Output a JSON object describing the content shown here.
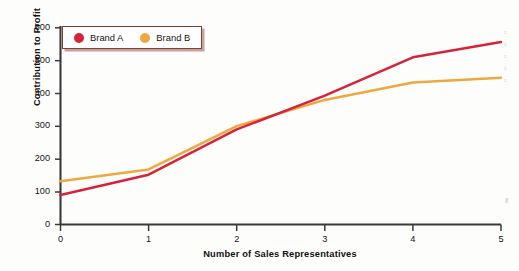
{
  "chart_data": {
    "type": "line",
    "title": "",
    "subtitle": "",
    "xlabel": "Number of Sales Representatives",
    "ylabel": "Contribution to Profit",
    "x": [
      0,
      1,
      2,
      3,
      4,
      5
    ],
    "xlim": [
      0,
      5
    ],
    "ylim": [
      0,
      600
    ],
    "x_ticks": [
      "0",
      "1",
      "2",
      "3",
      "4",
      "5"
    ],
    "y_ticks": [
      "0",
      "100",
      "200",
      "300",
      "400",
      "500",
      "600"
    ],
    "grid": false,
    "legend_position": "top-left",
    "series": [
      {
        "name": "Brand A",
        "color": "#D4233A",
        "values": [
          90,
          152,
          290,
          393,
          510,
          557
        ]
      },
      {
        "name": "Brand B",
        "color": "#EFA840",
        "values": [
          132,
          168,
          300,
          380,
          433,
          448
        ]
      }
    ],
    "annotations": []
  },
  "legend": {
    "entries": [
      {
        "label": "Brand A",
        "color": "#D4233A",
        "marker": "circle-marker"
      },
      {
        "label": "Brand B",
        "color": "#EFA840",
        "marker": "circle-marker"
      }
    ]
  },
  "axes": {
    "y_title": "Contribution to Profit",
    "x_title": "Number of Sales Representatives",
    "y_tick_labels": [
      "600",
      "500",
      "400",
      "300",
      "200",
      "100",
      "0"
    ],
    "x_tick_labels": [
      "0",
      "1",
      "2",
      "3",
      "4",
      "5"
    ],
    "axis_color": "#3a3a3a"
  },
  "edge_artifacts": {
    "fragments": [
      "≡",
      "≡",
      "≡",
      "≡",
      "≡"
    ],
    "bottom": "‖"
  }
}
